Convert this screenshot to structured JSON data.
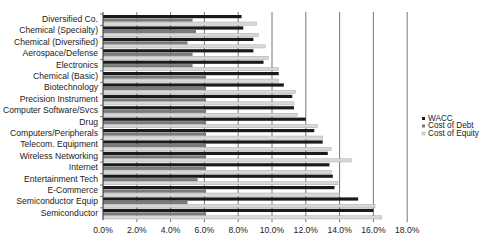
{
  "chart_data": {
    "type": "bar",
    "orientation": "horizontal",
    "title": "",
    "xlabel": "",
    "ylabel": "",
    "xlim": [
      0,
      18
    ],
    "x_ticks": [
      "0.0%",
      "2.0%",
      "4.0%",
      "6.0%",
      "8.0%",
      "10.0%",
      "12.0%",
      "14.0%",
      "16.0%",
      "18.0%"
    ],
    "grid": "vertical",
    "legend_position": "right",
    "categories": [
      "Diversified Co.",
      "Chemical (Specialty)",
      "Chemical (Diversified)",
      "Aerospace/Defense",
      "Electronics",
      "Chemical (Basic)",
      "Biotechnology",
      "Precision Instrument",
      "Computer Software/Svcs",
      "Drug",
      "Computers/Peripherals",
      "Telecom. Equipment",
      "Wireless Networking",
      "Internet",
      "Entertainment Tech",
      "E-Commerce",
      "Semiconductor Equip",
      "Semiconductor"
    ],
    "series": [
      {
        "name": "WACC",
        "color": "#1a1a1a",
        "values": [
          8.2,
          8.3,
          8.9,
          8.9,
          9.5,
          10.4,
          10.7,
          11.2,
          11.3,
          12.0,
          12.5,
          13.0,
          13.3,
          13.4,
          13.6,
          13.7,
          15.1,
          16.0
        ]
      },
      {
        "name": "Cost of Debt",
        "color": "#7a7a7a",
        "values": [
          5.3,
          5.5,
          5.0,
          5.3,
          5.3,
          6.1,
          6.1,
          6.1,
          6.1,
          6.1,
          6.1,
          6.1,
          6.1,
          6.1,
          5.6,
          6.1,
          5.0,
          6.1
        ]
      },
      {
        "name": "Cost of Equity",
        "color": "#d8d8d8",
        "values": [
          9.1,
          9.2,
          9.6,
          9.8,
          10.4,
          10.4,
          11.4,
          11.3,
          11.5,
          12.7,
          13.0,
          13.5,
          14.7,
          13.5,
          13.9,
          14.0,
          16.1,
          16.5
        ]
      }
    ]
  },
  "legend": {
    "items": [
      "WACC",
      "Cost of Debt",
      "Cost of Equity"
    ]
  }
}
